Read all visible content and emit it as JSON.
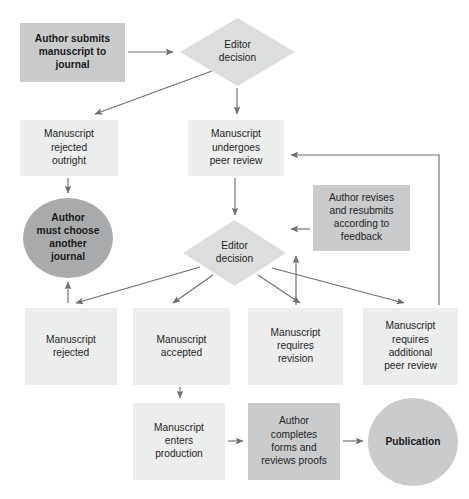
{
  "diagram": {
    "title_fragment": "",
    "canvas": {
      "width": 469,
      "height": 499
    },
    "colors": {
      "box_light": "#eceded",
      "box_medium": "#c9cbcc",
      "diamond": "#dcdddd",
      "circle_dark": "#a8aaab",
      "circle_light": "#c9cbcc",
      "edge": "#6b6f73",
      "text": "#262626",
      "background": "#ffffff"
    },
    "nodes": [
      {
        "id": "author-submits",
        "shape": "rect",
        "style": "medium",
        "bold": true,
        "x": 20,
        "y": 23,
        "w": 105,
        "h": 59,
        "lines": [
          "Author submits",
          "manuscript to",
          "journal"
        ]
      },
      {
        "id": "editor-decision-1",
        "shape": "diamond",
        "style": "diamond",
        "bold": false,
        "x": 180,
        "y": 18,
        "w": 115,
        "h": 68,
        "lines": [
          "Editor",
          "decision"
        ]
      },
      {
        "id": "manuscript-rejected-outright",
        "shape": "rect",
        "style": "light",
        "bold": false,
        "x": 20,
        "y": 120,
        "w": 98,
        "h": 56,
        "lines": [
          "Manuscript",
          "rejected",
          "outright"
        ]
      },
      {
        "id": "manuscript-undergoes-peer-review",
        "shape": "rect",
        "style": "light",
        "bold": false,
        "x": 188,
        "y": 120,
        "w": 96,
        "h": 56,
        "lines": [
          "Manuscript",
          "undergoes",
          "peer review"
        ]
      },
      {
        "id": "author-must-choose-another-journal",
        "shape": "circle",
        "style": "circle_dark",
        "bold": true,
        "x": 23,
        "y": 198,
        "w": 90,
        "h": 80,
        "lines": [
          "Author",
          "must choose",
          "another",
          "journal"
        ]
      },
      {
        "id": "author-revises-resubmits",
        "shape": "rect",
        "style": "medium",
        "bold": false,
        "x": 313,
        "y": 185,
        "w": 97,
        "h": 66,
        "lines": [
          "Author revises",
          "and resubmits",
          "according to",
          "feedback"
        ]
      },
      {
        "id": "editor-decision-2",
        "shape": "diamond",
        "style": "diamond",
        "bold": false,
        "x": 183,
        "y": 220,
        "w": 103,
        "h": 66,
        "lines": [
          "Editor",
          "decision"
        ]
      },
      {
        "id": "manuscript-rejected",
        "shape": "rect",
        "style": "light",
        "bold": false,
        "x": 25,
        "y": 308,
        "w": 92,
        "h": 77,
        "lines": [
          "Manuscript",
          "rejected"
        ]
      },
      {
        "id": "manuscript-accepted",
        "shape": "rect",
        "style": "light",
        "bold": false,
        "x": 133,
        "y": 308,
        "w": 97,
        "h": 77,
        "lines": [
          "Manuscript",
          "accepted"
        ]
      },
      {
        "id": "manuscript-requires-revision",
        "shape": "rect",
        "style": "light",
        "bold": false,
        "x": 248,
        "y": 308,
        "w": 95,
        "h": 77,
        "lines": [
          "Manuscript",
          "requires",
          "revision"
        ]
      },
      {
        "id": "manuscript-requires-additional-peer-review",
        "shape": "rect",
        "style": "light",
        "bold": false,
        "x": 363,
        "y": 308,
        "w": 95,
        "h": 77,
        "lines": [
          "Manuscript",
          "requires",
          "additional",
          "peer review"
        ]
      },
      {
        "id": "manuscript-enters-production",
        "shape": "rect",
        "style": "light",
        "bold": false,
        "x": 133,
        "y": 403,
        "w": 92,
        "h": 77,
        "lines": [
          "Manuscript",
          "enters",
          "production"
        ]
      },
      {
        "id": "author-completes-forms",
        "shape": "rect",
        "style": "medium",
        "bold": false,
        "x": 248,
        "y": 403,
        "w": 92,
        "h": 77,
        "lines": [
          "Author",
          "completes",
          "forms and",
          "reviews proofs"
        ]
      },
      {
        "id": "publication",
        "shape": "circle",
        "style": "circle_light",
        "bold": true,
        "x": 368,
        "y": 398,
        "w": 90,
        "h": 88,
        "lines": [
          "Publication"
        ]
      }
    ],
    "edges": [
      {
        "id": "submits-to-decision1",
        "from": "author-submits",
        "to": "editor-decision-1",
        "path": "M 128 52 L 173 52"
      },
      {
        "id": "decision1-to-rejected-outright",
        "from": "editor-decision-1",
        "to": "manuscript-rejected-outright",
        "path": "M 212 71 L 95 114"
      },
      {
        "id": "decision1-to-peer-review",
        "from": "editor-decision-1",
        "to": "manuscript-undergoes-peer-review",
        "path": "M 237 88 L 237 114"
      },
      {
        "id": "rejected-outright-to-choose-another",
        "from": "manuscript-rejected-outright",
        "to": "author-must-choose-another-journal",
        "path": "M 68 178 L 68 193"
      },
      {
        "id": "peer-review-to-decision2",
        "from": "manuscript-undergoes-peer-review",
        "to": "editor-decision-2",
        "path": "M 235 178 L 235 215"
      },
      {
        "id": "decision2-to-rejected",
        "from": "editor-decision-2",
        "to": "manuscript-rejected",
        "path": "M 200 267 L 76 303"
      },
      {
        "id": "decision2-to-accepted",
        "from": "editor-decision-2",
        "to": "manuscript-accepted",
        "path": "M 213 275 L 173 303"
      },
      {
        "id": "decision2-to-requires-revision",
        "from": "editor-decision-2",
        "to": "manuscript-requires-revision",
        "path": "M 258 275 L 300 303"
      },
      {
        "id": "decision2-to-requires-additional",
        "from": "editor-decision-2",
        "to": "manuscript-requires-additional-peer-review",
        "path": "M 272 268 L 404 303"
      },
      {
        "id": "revises-to-decision2",
        "from": "author-revises-resubmits",
        "to": "editor-decision-2",
        "path": "M 310 229 L 291 229"
      },
      {
        "id": "requires-revision-to-revises",
        "from": "manuscript-requires-revision",
        "to": "author-revises-resubmits",
        "path": "M 296 305 L 296 256"
      },
      {
        "id": "requires-additional-to-peer-review",
        "from": "manuscript-requires-additional-peer-review",
        "to": "manuscript-undergoes-peer-review",
        "path": "M 439 305 L 439 155 L 291 155"
      },
      {
        "id": "rejected-to-choose-another",
        "from": "manuscript-rejected",
        "to": "author-must-choose-another-journal",
        "path": "M 68 303 L 68 282"
      },
      {
        "id": "accepted-to-production",
        "from": "manuscript-accepted",
        "to": "manuscript-enters-production",
        "path": "M 180 387 L 180 398"
      },
      {
        "id": "production-to-completes-forms",
        "from": "manuscript-enters-production",
        "to": "author-completes-forms",
        "path": "M 228 441 L 243 441"
      },
      {
        "id": "completes-forms-to-publication",
        "from": "author-completes-forms",
        "to": "publication",
        "path": "M 343 441 L 363 441"
      }
    ]
  }
}
